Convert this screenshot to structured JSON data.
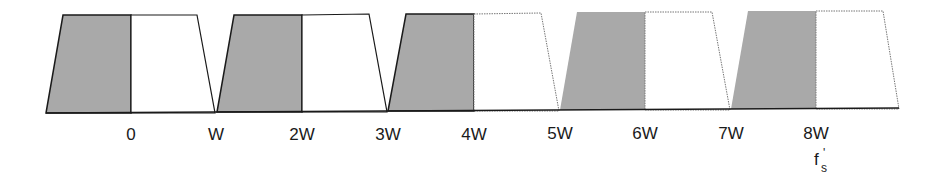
{
  "diagram": {
    "colors": {
      "shaded": "#a9a9a9",
      "stroke": "#1a1a1a",
      "baseline": "#1a1a1a",
      "background": "#ffffff"
    },
    "baseline_y": 112,
    "replicas": [
      {
        "name": "replica-1",
        "shaded_range": [
          "-W",
          "0"
        ],
        "clear_range": [
          "0",
          "W"
        ],
        "edge_style": "solid"
      },
      {
        "name": "replica-2",
        "shaded_range": [
          "W",
          "2W"
        ],
        "clear_range": [
          "2W",
          "3W"
        ],
        "edge_style": "solid"
      },
      {
        "name": "replica-3",
        "shaded_range": [
          "3W",
          "4W"
        ],
        "clear_range": [
          "4W",
          "5W"
        ],
        "edge_style": "solid-then-dotted"
      },
      {
        "name": "replica-4",
        "shaded_range": [
          "5W",
          "6W"
        ],
        "clear_range": [
          "6W",
          "7W"
        ],
        "edge_style": "dotted"
      },
      {
        "name": "replica-5",
        "shaded_range": [
          "7W",
          "8W"
        ],
        "clear_range": [
          "8W",
          "9W"
        ],
        "edge_style": "dotted"
      }
    ],
    "tick_labels": [
      "0",
      "W",
      "2W",
      "3W",
      "4W",
      "5W",
      "6W",
      "7W",
      "8W"
    ],
    "marker": {
      "main": "f",
      "prime": "'",
      "subscript": "s",
      "under_label": "8W"
    }
  }
}
